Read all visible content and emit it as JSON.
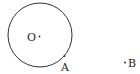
{
  "diagram": {
    "circle": {
      "center_label": "O",
      "cx": 40,
      "cy": 35,
      "r": 32,
      "stroke": "#333333"
    },
    "points": [
      {
        "label": "O",
        "x": 39.5,
        "y": 36.5
      },
      {
        "label": "A",
        "x": 64.5,
        "y": 56
      },
      {
        "label": "B",
        "x": 125,
        "y": 62.5
      }
    ],
    "labels": {
      "O": "O",
      "A": "A",
      "B": "B"
    }
  }
}
